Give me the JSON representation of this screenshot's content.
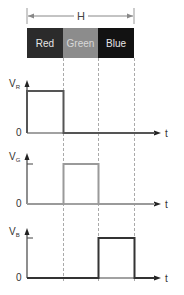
{
  "period_label": "H",
  "color_bar": [
    {
      "label": "Red",
      "fill": "#2b2b2b",
      "text_color": "#e6e6e6"
    },
    {
      "label": "Green",
      "fill": "#8c8c8c",
      "text_color": "#d8d8d8"
    },
    {
      "label": "Blue",
      "fill": "#121212",
      "text_color": "#e6e6e6"
    }
  ],
  "plots": [
    {
      "ylabel_main": "V",
      "ylabel_sub": "R",
      "zero": "0",
      "xlabel": "t",
      "pulse_slot": 0,
      "pulse_color": "#555555"
    },
    {
      "ylabel_main": "V",
      "ylabel_sub": "G",
      "zero": "0",
      "xlabel": "t",
      "pulse_slot": 1,
      "pulse_color": "#9a9a9a"
    },
    {
      "ylabel_main": "V",
      "ylabel_sub": "B",
      "zero": "0",
      "xlabel": "t",
      "pulse_slot": 2,
      "pulse_color": "#333333"
    }
  ],
  "colors": {
    "axis": "#444444",
    "dash": "#aaaaaa",
    "dimension": "#888888"
  }
}
